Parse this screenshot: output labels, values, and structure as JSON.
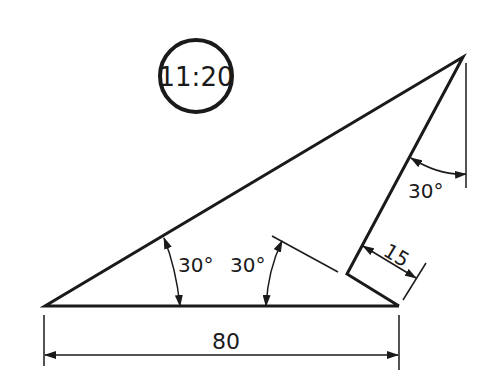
{
  "problem_number": "11:20",
  "dimensions": {
    "base_length": "80",
    "offset": "15"
  },
  "angles": {
    "apex_angle": "30°",
    "left_angle": "30°",
    "inner_angle": "30°"
  },
  "colors": {
    "line": "#1a1a1a",
    "background": "#ffffff"
  }
}
